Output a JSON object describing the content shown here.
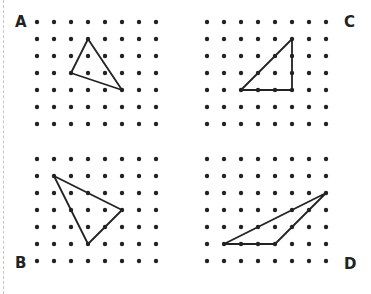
{
  "figure": {
    "dot_color": "#222222",
    "line_color": "#222222",
    "grid": {
      "columns": 8,
      "rows": 7,
      "spacing": 17
    },
    "panels": [
      {
        "label": "A",
        "label_pos": [
          15,
          15
        ],
        "origin": [
          37,
          22
        ],
        "triangle": [
          [
            3,
            1
          ],
          [
            2,
            3
          ],
          [
            5,
            4
          ]
        ]
      },
      {
        "label": "C",
        "label_pos": [
          344,
          15
        ],
        "origin": [
          207,
          22
        ],
        "triangle": [
          [
            5,
            1
          ],
          [
            2,
            4
          ],
          [
            5,
            4
          ]
        ]
      },
      {
        "label": "B",
        "label_pos": [
          15,
          256
        ],
        "origin": [
          37,
          159
        ],
        "triangle": [
          [
            1,
            1
          ],
          [
            5,
            3
          ],
          [
            3,
            5
          ]
        ]
      },
      {
        "label": "D",
        "label_pos": [
          344,
          257
        ],
        "origin": [
          207,
          159
        ],
        "triangle": [
          [
            7,
            2
          ],
          [
            1,
            5
          ],
          [
            4,
            5
          ]
        ]
      }
    ]
  }
}
